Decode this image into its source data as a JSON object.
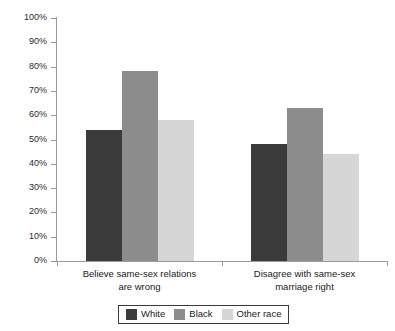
{
  "chart_data": {
    "type": "bar",
    "title": "",
    "subtitle": "",
    "xlabel": "",
    "ylabel": "",
    "ylim": [
      0,
      100
    ],
    "grid": false,
    "legend_position": "bottom-center",
    "categories": [
      "Believe same-sex relations\nare wrong",
      "Disagree with same-sex\nmarriage right"
    ],
    "series": [
      {
        "name": "White",
        "color": "#3b3b3b",
        "values": [
          54,
          48
        ]
      },
      {
        "name": "Black",
        "color": "#8c8c8c",
        "values": [
          78,
          63
        ]
      },
      {
        "name": "Other race",
        "color": "#d6d6d6",
        "values": [
          58,
          44
        ]
      }
    ],
    "y_ticks": [
      {
        "value": 100,
        "label": "100%"
      },
      {
        "value": 90,
        "label": "90%"
      },
      {
        "value": 80,
        "label": "80%"
      },
      {
        "value": 70,
        "label": "70%"
      },
      {
        "value": 60,
        "label": "60%"
      },
      {
        "value": 50,
        "label": "50%"
      },
      {
        "value": 40,
        "label": "40%"
      },
      {
        "value": 30,
        "label": "30%"
      },
      {
        "value": 20,
        "label": "20%"
      },
      {
        "value": 10,
        "label": "10%"
      },
      {
        "value": 0,
        "label": "0%"
      }
    ],
    "legend": [
      {
        "label": "White",
        "swatch": "white"
      },
      {
        "label": "Black",
        "swatch": "black"
      },
      {
        "label": "Other race",
        "swatch": "other"
      }
    ]
  }
}
